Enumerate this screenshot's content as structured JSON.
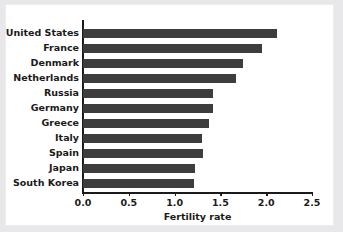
{
  "chart_data": {
    "type": "bar",
    "orientation": "horizontal",
    "title": "",
    "xlabel": "Fertility rate",
    "ylabel": "",
    "xlim": [
      0.0,
      2.5
    ],
    "xticks": [
      "0.0",
      "0.5",
      "1.0",
      "1.5",
      "2.0",
      "2.5"
    ],
    "xtick_values": [
      0.0,
      0.5,
      1.0,
      1.5,
      2.0,
      2.5
    ],
    "grid": false,
    "legend": null,
    "bar_color": "#3d3d3d",
    "axis_color": "#1a1a1a",
    "background_color": "#ffffff",
    "categories": [
      "United States",
      "France",
      "Denmark",
      "Netherlands",
      "Russia",
      "Germany",
      "Greece",
      "Italy",
      "Spain",
      "Japan",
      "South Korea"
    ],
    "values": [
      2.12,
      1.95,
      1.75,
      1.67,
      1.42,
      1.42,
      1.38,
      1.3,
      1.31,
      1.22,
      1.21
    ]
  }
}
